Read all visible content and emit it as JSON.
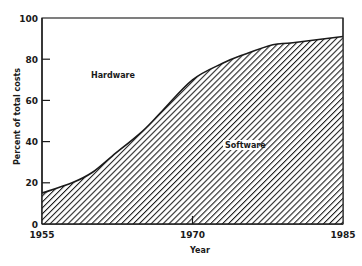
{
  "chart_data": {
    "type": "area",
    "title": "",
    "xlabel": "Year",
    "ylabel": "Percent of total costs",
    "xlim": [
      1955,
      1985
    ],
    "ylim": [
      0,
      100
    ],
    "x_ticks": [
      1955,
      1970,
      1985
    ],
    "y_ticks": [
      0,
      20,
      40,
      60,
      80,
      100
    ],
    "grid": false,
    "legend": "none",
    "annotations": [
      {
        "text": "Hardware",
        "region": "above curve"
      },
      {
        "text": "Software",
        "region": "below curve (hatched)"
      }
    ],
    "x": [
      1955,
      1958,
      1960,
      1962,
      1965,
      1967,
      1970,
      1973,
      1975,
      1978,
      1980,
      1985
    ],
    "series": [
      {
        "name": "Software",
        "fill": "diagonal hatch",
        "values": [
          15,
          20,
          25,
          33,
          45,
          55,
          70,
          78,
          82,
          87,
          88,
          91
        ]
      },
      {
        "name": "Hardware",
        "fill": "white",
        "values": [
          85,
          80,
          75,
          67,
          55,
          45,
          30,
          22,
          18,
          13,
          12,
          9
        ]
      }
    ]
  },
  "labels": {
    "hardware": "Hardware",
    "software": "Software",
    "xlabel": "Year",
    "ylabel": "Percent of total costs",
    "y_ticks": [
      "0",
      "20",
      "40",
      "60",
      "80",
      "100"
    ],
    "x_ticks": [
      "1955",
      "1970",
      "1985"
    ]
  },
  "colors": {
    "ink": "#1a1a1a",
    "background": "#ffffff"
  }
}
